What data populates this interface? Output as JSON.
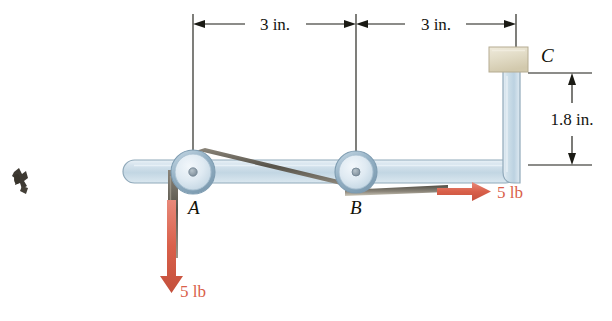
{
  "figure": {
    "dimensions": {
      "span_left": "3 in.",
      "span_right": "3 in.",
      "height_c": "1.8 in."
    },
    "labels": {
      "pulley_a": "A",
      "pulley_b": "B",
      "block_c": "C"
    },
    "forces": {
      "vertical": "5 lb",
      "horizontal": "5 lb"
    },
    "colors": {
      "bar_fill": "#ccdbe6",
      "bar_stroke": "#8fa8b8",
      "pulley_fill": "#dde7ef",
      "pulley_rim": "#8aa6ba",
      "hub": "#8a9aa6",
      "belt": "#6f6a5e",
      "block_fill": "#e3ddc8",
      "block_stroke": "#b5ac92",
      "force_red": "#d9604a",
      "dim_black": "#1a1a14",
      "page_bg": "#ffffff"
    },
    "geometry": {
      "pulley_a_center_x": 193,
      "pulley_a_center_y": 172,
      "pulley_b_center_x": 356,
      "pulley_b_center_y": 172,
      "pulley_radius": 22,
      "right_edge_x": 516,
      "dim_top_y": 24,
      "dim_c_top_y": 73,
      "dim_c_bottom_y": 165
    }
  }
}
